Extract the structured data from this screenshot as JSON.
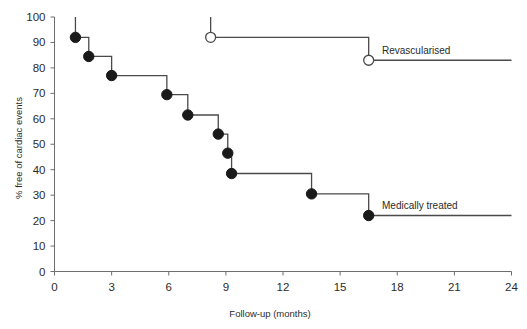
{
  "chart_data": {
    "type": "line",
    "subtype": "kaplan-meier-step",
    "title": "",
    "xlabel": "Follow-up (months)",
    "ylabel": "% free of cardiac events",
    "xlim": [
      0,
      24
    ],
    "ylim": [
      0,
      100
    ],
    "xticks": [
      0,
      3,
      6,
      9,
      12,
      15,
      18,
      21,
      24
    ],
    "xtick_labels": [
      "0",
      "3",
      "6",
      "9",
      "12",
      "15",
      "18",
      "21",
      "24"
    ],
    "yticks": [
      0,
      10,
      20,
      30,
      40,
      50,
      60,
      70,
      80,
      90,
      100
    ],
    "ytick_labels": [
      "0",
      "10",
      "20",
      "30",
      "40",
      "50",
      "60",
      "70",
      "80",
      "90",
      "100"
    ],
    "grid": false,
    "legend_position": "inline-annotation",
    "series": [
      {
        "name": "Revascularised",
        "marker": "open-circle",
        "label": "Revascularised",
        "label_x": 17.2,
        "label_y": 85.5,
        "x": [
          8.2,
          16.5
        ],
        "y": [
          92,
          83
        ],
        "censor_ticks": [
          {
            "x": 8.2,
            "y_top": 100,
            "y_bottom": 92
          }
        ],
        "end_x": 24,
        "end_y": 83
      },
      {
        "name": "Medically treated",
        "marker": "filled-circle",
        "label": "Medically treated",
        "label_x": 17.2,
        "label_y": 24.5,
        "x": [
          1.1,
          1.8,
          3.0,
          5.9,
          7.0,
          8.6,
          9.1,
          9.3,
          13.5,
          16.5
        ],
        "y": [
          92,
          84.5,
          77,
          69.5,
          61.5,
          54,
          46.5,
          38.5,
          30.5,
          22
        ],
        "censor_ticks": [
          {
            "x": 1.1,
            "y_top": 100,
            "y_bottom": 92
          }
        ],
        "end_x": 24,
        "end_y": 22
      }
    ]
  },
  "axes": {
    "x_title": "Follow-up (months)",
    "y_title": "% free of cardiac events"
  },
  "colors": {
    "axis": "#6e6e6e",
    "line": "#4a4a4a",
    "marker_filled": "#1a1a1a",
    "marker_open_fill": "#ffffff",
    "text": "#2b2b2b",
    "background": "#ffffff"
  },
  "labels": {
    "revascularised": "Revascularised",
    "medically_treated": "Medically treated"
  }
}
